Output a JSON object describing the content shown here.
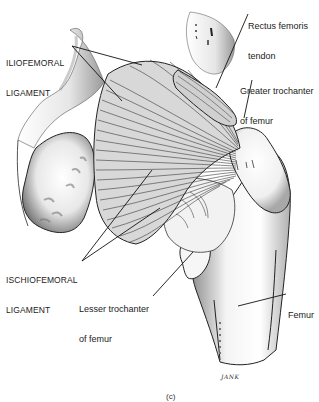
{
  "figure": {
    "caption": "(c)",
    "signature": "JANK"
  },
  "labels": {
    "iliofemoral": {
      "line1": "ILIOFEMORAL",
      "line2": "LIGAMENT"
    },
    "ischiofemoral": {
      "line1": "ISCHIOFEMORAL",
      "line2": "LIGAMENT"
    },
    "rectus_femoris": {
      "line1": "Rectus femoris",
      "line2": "tendon"
    },
    "greater_trochanter": {
      "line1": "Greater trochanter",
      "line2": "of femur"
    },
    "lesser_trochanter": {
      "line1": "Lesser trochanter",
      "line2": "of femur"
    },
    "femur": {
      "line1": "Femur"
    }
  },
  "colors": {
    "ink": "#1a1a1a",
    "bone_shade": "#9a9a9a",
    "ligament_fill": "#d4d4d4",
    "background": "#ffffff"
  }
}
